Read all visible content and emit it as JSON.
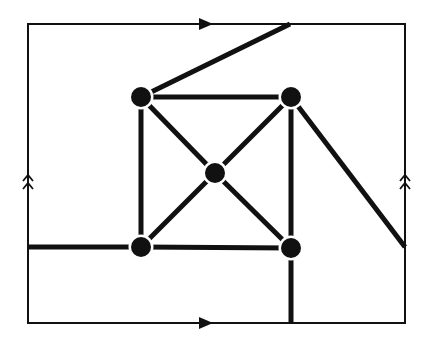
{
  "diagram": {
    "colors": {
      "background": "#ffffff",
      "stroke": "#111111",
      "vertex": "#111111"
    },
    "boundary": {
      "x1": 28,
      "y1": 24,
      "x2": 405,
      "y2": 323,
      "stroke_width": 2,
      "identifications": [
        {
          "side": "top",
          "marker": "single-arrow",
          "direction": "right",
          "at": [
            205,
            24
          ]
        },
        {
          "side": "bottom",
          "marker": "single-arrow",
          "direction": "right",
          "at": [
            205,
            323
          ]
        },
        {
          "side": "left",
          "marker": "double-chevron",
          "direction": "up",
          "at": [
            28,
            180
          ]
        },
        {
          "side": "right",
          "marker": "double-chevron",
          "direction": "up",
          "at": [
            405,
            180
          ]
        }
      ]
    },
    "vertices": [
      {
        "id": "top-left",
        "x": 141,
        "y": 97
      },
      {
        "id": "top-right",
        "x": 291,
        "y": 97
      },
      {
        "id": "center",
        "x": 215,
        "y": 173
      },
      {
        "id": "bottom-left",
        "x": 141,
        "y": 247
      },
      {
        "id": "bottom-right",
        "x": 291,
        "y": 248
      }
    ],
    "vertex_radius": 10,
    "edges": [
      {
        "id": "square-top",
        "from": [
          141,
          97
        ],
        "to": [
          291,
          97
        ]
      },
      {
        "id": "square-bottom",
        "from": [
          141,
          247
        ],
        "to": [
          291,
          248
        ]
      },
      {
        "id": "square-left",
        "from": [
          141,
          97
        ],
        "to": [
          141,
          247
        ]
      },
      {
        "id": "square-right",
        "from": [
          291,
          97
        ],
        "to": [
          291,
          248
        ]
      },
      {
        "id": "diag-tl-center",
        "from": [
          141,
          97
        ],
        "to": [
          215,
          173
        ]
      },
      {
        "id": "diag-center-br",
        "from": [
          215,
          173
        ],
        "to": [
          291,
          248
        ]
      },
      {
        "id": "diag-tr-center",
        "from": [
          291,
          97
        ],
        "to": [
          215,
          173
        ]
      },
      {
        "id": "diag-center-bl",
        "from": [
          215,
          173
        ],
        "to": [
          141,
          247
        ]
      },
      {
        "id": "wrap-tl-top",
        "from": [
          141,
          97
        ],
        "to": [
          290,
          24
        ]
      },
      {
        "id": "wrap-tr-right",
        "from": [
          291,
          97
        ],
        "to": [
          405,
          247
        ]
      },
      {
        "id": "wrap-bl-left",
        "from": [
          141,
          247
        ],
        "to": [
          28,
          247
        ]
      },
      {
        "id": "wrap-br-bottom",
        "from": [
          291,
          248
        ],
        "to": [
          291,
          323
        ]
      }
    ],
    "edge_stroke_width": 5
  }
}
